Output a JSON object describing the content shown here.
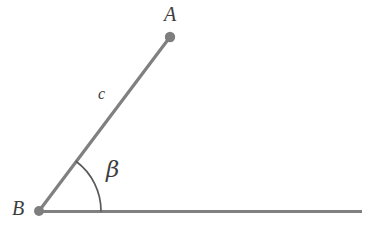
{
  "figure": {
    "background_color": "#ffffff",
    "stroke_color": "#808080",
    "arc_color": "#595959",
    "point_color": "#7e7e7e",
    "text_color": "#3c3c3c"
  },
  "labels": {
    "vertex_a": "A",
    "vertex_b": "B",
    "side_c": "c",
    "angle_beta": "β"
  },
  "geometry": {
    "points": [
      {
        "name": "A",
        "x": 170,
        "y": 37
      },
      {
        "name": "B",
        "x": 39,
        "y": 211
      }
    ],
    "segments": [
      {
        "name": "c",
        "from": "B",
        "to": "A",
        "x1": 39,
        "y1": 211,
        "x2": 170,
        "y2": 37
      },
      {
        "name": "horizontal-ray",
        "from": "B",
        "x1": 39,
        "y1": 211,
        "x2": 362,
        "y2": 211
      }
    ],
    "angle_arc": {
      "name": "beta",
      "vertex": "B",
      "radius": 62,
      "start_angle_deg": 0,
      "end_angle_deg": 53,
      "measure_deg": 53
    }
  }
}
